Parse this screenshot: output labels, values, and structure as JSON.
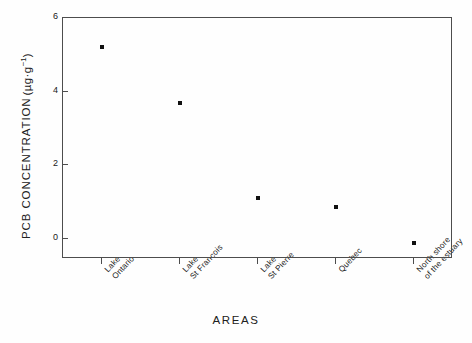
{
  "chart_data": {
    "type": "scatter",
    "title": "",
    "xlabel": "AREAS",
    "ylabel": "PCB CONCENTRATION",
    "ylabel_prefix": "PCB CONCENTRATION",
    "yunit_open": "(",
    "yunit_body": "µg·g",
    "yunit_sup": "−1",
    "yunit_close": ")",
    "categories": [
      "Lake\nOntario",
      "Lake\nSt Francois",
      "Lake\nSt Pierre",
      "Quebec",
      "North shore\nof the estuary"
    ],
    "category_lines": [
      [
        "Lake",
        "Ontario"
      ],
      [
        "Lake",
        "St Francois"
      ],
      [
        "Lake",
        "St Pierre"
      ],
      [
        "Quebec"
      ],
      [
        "North shore",
        "of the estuary"
      ]
    ],
    "values": [
      5.22,
      3.7,
      1.11,
      0.85,
      -0.11
    ],
    "ylim": [
      -0.55,
      6.0
    ],
    "yticks": [
      0,
      2,
      4,
      6
    ],
    "ytick_labels": [
      "0",
      "2",
      "4",
      "6"
    ],
    "xlim": [
      0.5,
      5.5
    ],
    "grid": false,
    "legend": null,
    "marker": "square",
    "marker_color": "#111111",
    "axis_color": "#4d4d4d",
    "background": "#fefefe"
  }
}
